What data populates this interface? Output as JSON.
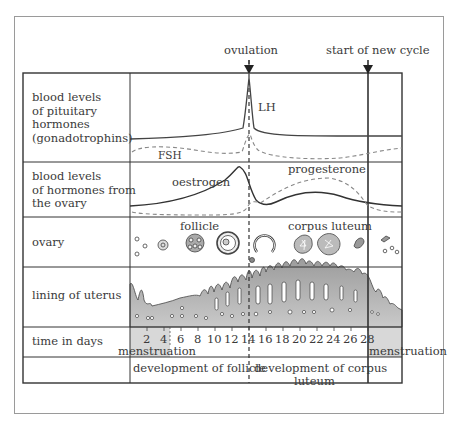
{
  "annotations": {
    "ovulation": "ovulation",
    "start_new_cycle": "start of new cycle"
  },
  "rows": [
    {
      "label_lines": [
        "blood levels",
        "of pituitary",
        "hormones",
        "(gonadotrophins)"
      ]
    },
    {
      "label_lines": [
        "blood levels",
        "of hormones from",
        "the ovary"
      ]
    },
    {
      "label_lines": [
        "ovary"
      ]
    },
    {
      "label_lines": [
        "lining of uterus"
      ]
    },
    {
      "label_lines": [
        "time in days"
      ]
    },
    {
      "label_lines": [
        ""
      ]
    }
  ],
  "curves": {
    "lh": "LH",
    "fsh": "FSH",
    "oestrogen": "oestrogen",
    "progesterone": "progesterone"
  },
  "ovary_labels": {
    "follicle": "follicle",
    "corpus_luteum": "corpus luteum"
  },
  "days": [
    "2",
    "4",
    "6",
    "8",
    "10",
    "12",
    "14",
    "16",
    "18",
    "20",
    "22",
    "24",
    "26",
    "28"
  ],
  "menstruation_left": "menstruation",
  "menstruation_right": "menstruation",
  "phases": {
    "follicle": "development of follicle",
    "corpus_luteum_line1": "development of corpus",
    "corpus_luteum_line2": "luteum"
  },
  "colors": {
    "line": "#333333",
    "dashed": "#888888",
    "tissue": "#a9a9a9",
    "menstruation_band": "#d8d8d8",
    "frame": "#9a9a9a"
  }
}
